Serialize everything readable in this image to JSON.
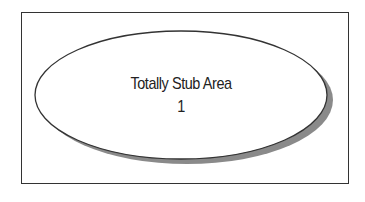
{
  "diagram": {
    "shape": "ellipse",
    "label_line1": "Totally Stub Area",
    "label_line2": "1",
    "colors": {
      "border": "#333333",
      "fill": "#ffffff",
      "shadow": "#8a8a8a"
    }
  }
}
